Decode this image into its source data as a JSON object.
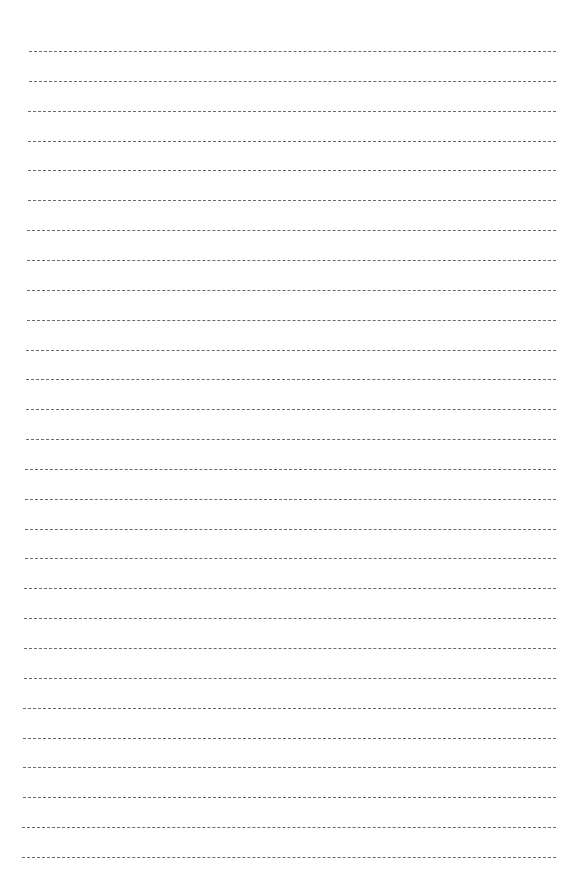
{
  "page": {
    "type": "blank lined writing sheet",
    "line_count": 28,
    "line_style": "dashed",
    "line_color": "#6b6b6b",
    "background": "#ffffff",
    "first_line_y": 51,
    "last_line_y": 857,
    "left_top": 29,
    "left_bottom": 22,
    "right": 556
  }
}
